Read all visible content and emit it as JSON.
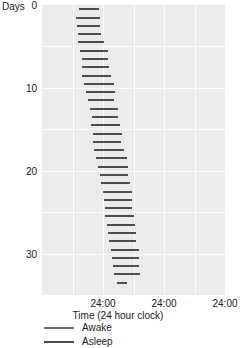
{
  "chart_data": {
    "type": "bar",
    "title": "",
    "subtitle": "",
    "xlabel": "Time (24 hour clock)",
    "ylabel": "Days",
    "orientation": "horizontal",
    "grid": true,
    "legend_position": "below-axis",
    "axes": {
      "x": {
        "label": "Time (24 hour clock)",
        "unit": "hours",
        "range_hours": [
          0,
          72
        ],
        "major_tick_hours": 24,
        "minor_gridline_hours": 12,
        "tick_labels": [
          "24:00",
          "24:00",
          "24:00"
        ],
        "tick_positions_hours": [
          24,
          48,
          72
        ]
      },
      "y": {
        "label": "Days",
        "range": [
          0,
          35
        ],
        "tick_labels": [
          "0",
          "10",
          "20",
          "30"
        ],
        "tick_values": [
          0,
          10,
          20,
          30
        ],
        "direction": "top-to-bottom"
      }
    },
    "series": [
      {
        "name": "Awake",
        "color": "#6e6e6e",
        "role": "legend-only",
        "values": []
      },
      {
        "name": "Asleep",
        "color": "#4d4d4d",
        "role": "plotted-bars",
        "value_units": "hours from chart origin",
        "values": [
          {
            "day": 0,
            "start": 14.6,
            "end": 22.3
          },
          {
            "day": 1,
            "start": 13.3,
            "end": 22.9
          },
          {
            "day": 2,
            "start": 13.6,
            "end": 22.9
          },
          {
            "day": 3,
            "start": 14.0,
            "end": 23.2
          },
          {
            "day": 4,
            "start": 14.1,
            "end": 24.6
          },
          {
            "day": 5,
            "start": 15.0,
            "end": 26.0
          },
          {
            "day": 6,
            "start": 15.7,
            "end": 25.8
          },
          {
            "day": 7,
            "start": 15.6,
            "end": 26.4
          },
          {
            "day": 8,
            "start": 15.9,
            "end": 27.1
          },
          {
            "day": 9,
            "start": 16.6,
            "end": 28.4
          },
          {
            "day": 10,
            "start": 17.3,
            "end": 28.5
          },
          {
            "day": 11,
            "start": 17.9,
            "end": 28.5
          },
          {
            "day": 12,
            "start": 18.9,
            "end": 29.7
          },
          {
            "day": 13,
            "start": 19.5,
            "end": 29.8
          },
          {
            "day": 14,
            "start": 19.3,
            "end": 30.7
          },
          {
            "day": 15,
            "start": 19.9,
            "end": 31.4
          },
          {
            "day": 16,
            "start": 20.2,
            "end": 31.1
          },
          {
            "day": 17,
            "start": 20.6,
            "end": 32.3
          },
          {
            "day": 18,
            "start": 21.4,
            "end": 33.4
          },
          {
            "day": 19,
            "start": 22.1,
            "end": 33.9
          },
          {
            "day": 20,
            "start": 22.7,
            "end": 34.0
          },
          {
            "day": 21,
            "start": 23.2,
            "end": 34.4
          },
          {
            "day": 22,
            "start": 23.9,
            "end": 35.6
          },
          {
            "day": 23,
            "start": 24.4,
            "end": 35.5
          },
          {
            "day": 24,
            "start": 24.6,
            "end": 35.5
          },
          {
            "day": 25,
            "start": 24.8,
            "end": 36.0
          },
          {
            "day": 26,
            "start": 25.5,
            "end": 36.7
          },
          {
            "day": 27,
            "start": 26.1,
            "end": 37.1
          },
          {
            "day": 28,
            "start": 26.4,
            "end": 37.1
          },
          {
            "day": 29,
            "start": 27.0,
            "end": 38.0
          },
          {
            "day": 30,
            "start": 27.7,
            "end": 38.2
          },
          {
            "day": 31,
            "start": 28.1,
            "end": 38.1
          },
          {
            "day": 32,
            "start": 28.4,
            "end": 38.5
          },
          {
            "day": 33,
            "start": 29.3,
            "end": 33.3
          }
        ]
      }
    ],
    "legend": [
      {
        "label": "Awake",
        "color": "#6e6e6e"
      },
      {
        "label": "Asleep",
        "color": "#4d4d4d"
      }
    ],
    "style": {
      "panel_background": "#ebebeb",
      "gridline_color": "#fbfbfb",
      "bar_color": "#4d4d4d",
      "text_color": "#1a1a1a"
    }
  }
}
